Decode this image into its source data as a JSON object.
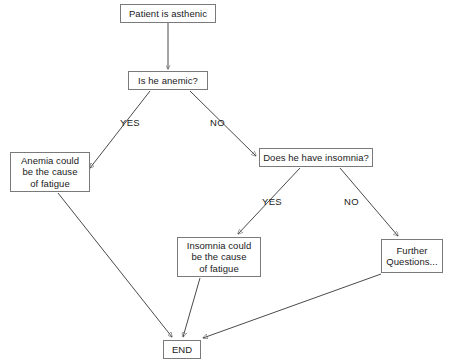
{
  "diagram": {
    "background_color": "#ffffff",
    "box_border_color": "#7a7a7a",
    "edge_color": "#4a4a4a",
    "text_color": "#1a1a1a",
    "nodes": [
      {
        "id": "start",
        "label": "Patient is asthenic",
        "type": "process",
        "x": 120,
        "y": 4,
        "w": 96,
        "h": 19
      },
      {
        "id": "anemic",
        "label": "Is he anemic?",
        "type": "decision",
        "x": 128,
        "y": 71,
        "w": 80,
        "h": 19
      },
      {
        "id": "anemia",
        "label": "Anemia could\nbe the cause\nof fatigue",
        "type": "terminal",
        "x": 10,
        "y": 152,
        "w": 80,
        "h": 40
      },
      {
        "id": "insomnia_q",
        "label": "Does he have insomnia?",
        "type": "decision",
        "x": 259,
        "y": 148,
        "w": 114,
        "h": 19
      },
      {
        "id": "insomnia",
        "label": "Insomnia could\nbe the cause\nof fatigue",
        "type": "terminal",
        "x": 177,
        "y": 237,
        "w": 84,
        "h": 40
      },
      {
        "id": "further",
        "label": "Further\nQuestions...",
        "type": "terminal",
        "x": 381,
        "y": 239,
        "w": 62,
        "h": 34
      },
      {
        "id": "end",
        "label": "END",
        "type": "terminal",
        "x": 163,
        "y": 340,
        "w": 38,
        "h": 19
      }
    ],
    "edge_labels": [
      {
        "id": "anemic-yes",
        "text": "YES",
        "x": 120,
        "y": 117
      },
      {
        "id": "anemic-no",
        "text": "NO",
        "x": 210,
        "y": 117
      },
      {
        "id": "insomnia-yes",
        "text": "YES",
        "x": 262,
        "y": 196
      },
      {
        "id": "insomnia-no",
        "text": "NO",
        "x": 344,
        "y": 196
      }
    ],
    "edges": [
      {
        "id": "start-to-anemic",
        "from": "start",
        "to": "anemic",
        "label": ""
      },
      {
        "id": "anemic-yes-to-anemia",
        "from": "anemic",
        "to": "anemia",
        "label": "YES"
      },
      {
        "id": "anemic-no-to-insomnia",
        "from": "anemic",
        "to": "insomnia_q",
        "label": "NO"
      },
      {
        "id": "insomnia-yes-to-result",
        "from": "insomnia_q",
        "to": "insomnia",
        "label": "YES"
      },
      {
        "id": "insomnia-no-to-further",
        "from": "insomnia_q",
        "to": "further",
        "label": "NO"
      },
      {
        "id": "anemia-to-end",
        "from": "anemia",
        "to": "end",
        "label": ""
      },
      {
        "id": "insomnia-to-end",
        "from": "insomnia",
        "to": "end",
        "label": ""
      },
      {
        "id": "further-to-end",
        "from": "further",
        "to": "end",
        "label": ""
      }
    ]
  }
}
